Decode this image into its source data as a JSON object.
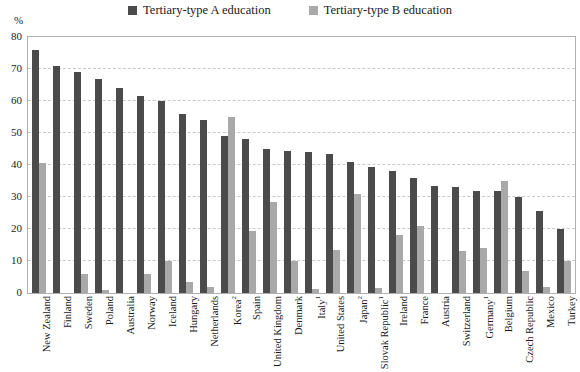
{
  "unit_label": "%",
  "legend": {
    "items": [
      {
        "label": "Tertiary-type A education",
        "color": "#4b4b4b",
        "icon": "square-marker-icon"
      },
      {
        "label": "Tertiary-type B education",
        "color": "#a9a9a9",
        "icon": "square-marker-icon"
      }
    ]
  },
  "chart_data": {
    "type": "bar",
    "title": "",
    "subtitle": "",
    "xlabel": "",
    "ylabel": "%",
    "ylim": [
      0,
      80
    ],
    "yticks": [
      0,
      10,
      20,
      30,
      40,
      50,
      60,
      70,
      80
    ],
    "ytick_labels": [
      "0",
      "10",
      "20",
      "30",
      "40",
      "50",
      "60",
      "70",
      "80"
    ],
    "grid": true,
    "legend_position": "top-center",
    "categories": [
      "New Zealand",
      "Finland",
      "Sweden",
      "Poland",
      "Australia",
      "Norway",
      "Iceland",
      "Hungary",
      "Netherlands",
      "Korea2",
      "Spain",
      "United Kingdom",
      "Denmark",
      "Italy1",
      "United States",
      "Japan2",
      "Slovak Republic1",
      "Ireland",
      "France",
      "Austria",
      "Switzerland",
      "Germany1",
      "Belgium",
      "Czech Republic",
      "Mexico",
      "Turkey"
    ],
    "category_labels": [
      "New Zealand",
      "Finland",
      "Sweden",
      "Poland",
      "Australia",
      "Norway",
      "Iceland",
      "Hungary",
      "Netherlands",
      "Korea",
      "Spain",
      "United Kingdom",
      "Denmark",
      "Italy",
      "United States",
      "Japan",
      "Slovak Republic",
      "Ireland",
      "France",
      "Austria",
      "Switzerland",
      "Germany",
      "Belgium",
      "Czech Republic",
      "Mexico",
      "Turkey"
    ],
    "category_footnotes": [
      "",
      "",
      "",
      "",
      "",
      "",
      "",
      "",
      "",
      "2",
      "",
      "",
      "",
      "1",
      "",
      "2",
      "1",
      "",
      "",
      "",
      "",
      "1",
      "",
      "",
      "",
      ""
    ],
    "series": [
      {
        "name": "Tertiary-type A education",
        "color": "#4b4b4b",
        "values": [
          76,
          71,
          69,
          67,
          64,
          61.5,
          60,
          56,
          54,
          49,
          48,
          45,
          44.5,
          44,
          43.5,
          41,
          39.5,
          38,
          36,
          33.5,
          33,
          32,
          32,
          30,
          25.5,
          20
        ]
      },
      {
        "name": "Tertiary-type B education",
        "color": "#a9a9a9",
        "values": [
          40.5,
          0,
          6,
          0.8,
          0,
          6,
          10,
          3.5,
          2,
          55,
          19.5,
          28.5,
          10,
          1.2,
          13.5,
          31,
          1.5,
          18,
          21,
          0,
          13,
          14,
          35,
          7,
          2,
          10
        ]
      }
    ]
  }
}
